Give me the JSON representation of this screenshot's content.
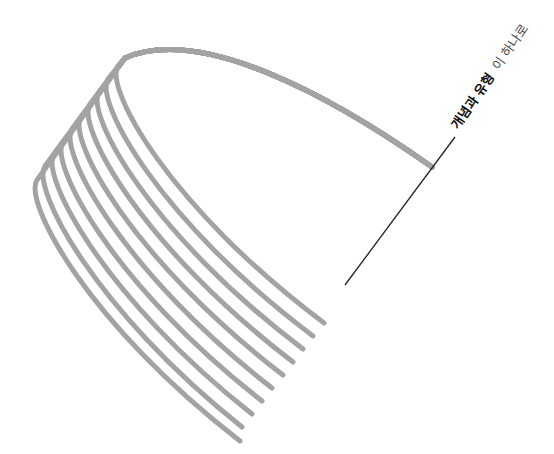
{
  "diagram": {
    "label": {
      "bold_part": "개념과 유형",
      "light_part": "이 하나로",
      "bold_color": "#111111",
      "light_color": "#444444",
      "font_size": 13,
      "x": 458,
      "y": 130,
      "rotation_deg": -55
    },
    "leader_line": {
      "x1": 345,
      "y1": 285,
      "x2": 455,
      "y2": 137,
      "color": "#222222",
      "width": 1.3
    },
    "fan": {
      "stroke_color": "#a3a3a3",
      "stroke_width": 5,
      "line_count": 10,
      "top_arc": {
        "start": [
          432,
          167
        ],
        "ctrl1": [
          330,
          95
        ],
        "ctrl2": [
          200,
          25
        ],
        "apex": [
          125,
          58
        ]
      },
      "lines": [
        {
          "branch": [
            118,
            66
          ],
          "end": [
            324,
            323
          ]
        },
        {
          "branch": [
            108,
            79
          ],
          "end": [
            313,
            336
          ]
        },
        {
          "branch": [
            99,
            92
          ],
          "end": [
            303,
            349
          ]
        },
        {
          "branch": [
            90,
            104
          ],
          "end": [
            293,
            362
          ]
        },
        {
          "branch": [
            81,
            117
          ],
          "end": [
            283,
            375
          ]
        },
        {
          "branch": [
            72,
            129
          ],
          "end": [
            272,
            388
          ]
        },
        {
          "branch": [
            63,
            142
          ],
          "end": [
            262,
            401
          ]
        },
        {
          "branch": [
            54,
            154
          ],
          "end": [
            252,
            414
          ]
        },
        {
          "branch": [
            45,
            166
          ],
          "end": [
            242,
            427
          ]
        },
        {
          "branch": [
            37,
            180
          ],
          "end": [
            240,
            441
          ]
        }
      ]
    }
  }
}
